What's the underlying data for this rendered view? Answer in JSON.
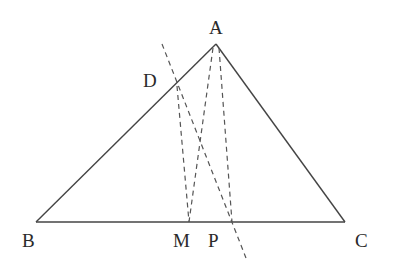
{
  "diagram": {
    "type": "geometry-triangle",
    "labels": {
      "A": "A",
      "B": "B",
      "C": "C",
      "D": "D",
      "M": "M",
      "P": "P"
    },
    "points": {
      "A": [
        216,
        44
      ],
      "B": [
        36,
        222
      ],
      "C": [
        345,
        222
      ],
      "D": [
        177,
        86
      ],
      "M": [
        189,
        222
      ],
      "P": [
        232,
        222
      ]
    },
    "solid_segments": [
      [
        "A",
        "B"
      ],
      [
        "A",
        "C"
      ],
      [
        "B",
        "C"
      ]
    ],
    "dashed_segments": [
      [
        "A",
        "M"
      ],
      [
        "A",
        "P"
      ],
      [
        "D",
        "M"
      ],
      [
        "line-through-D-P"
      ]
    ],
    "colors": {
      "stroke": "#444444",
      "text": "#2a2a2a",
      "background": "#ffffff"
    }
  }
}
